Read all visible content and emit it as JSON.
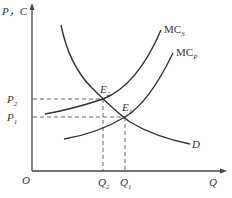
{
  "diagram": {
    "title": "",
    "axes": {
      "y_label": "P，C",
      "x_label": "Q",
      "origin_label": "O"
    },
    "curves": [
      {
        "id": "D",
        "label": "D",
        "description": "Demand curve, downward sloping"
      },
      {
        "id": "MCs",
        "label": "MC",
        "label_sub": "S",
        "description": "Social marginal cost curve"
      },
      {
        "id": "MCp",
        "label": "MC",
        "label_sub": "P",
        "description": "Private marginal cost curve"
      }
    ],
    "points": [
      {
        "id": "E2",
        "label": "E",
        "label_sub": "2",
        "description": "Intersection of D and MCs"
      },
      {
        "id": "E1",
        "label": "E",
        "label_sub": "1",
        "description": "Intersection of D and MCp"
      }
    ],
    "y_ticks": [
      {
        "label": "P",
        "sub": "2"
      },
      {
        "label": "P",
        "sub": "1"
      }
    ],
    "x_ticks": [
      {
        "label": "Q",
        "sub": "2"
      },
      {
        "label": "Q",
        "sub": "1"
      }
    ],
    "colors": {
      "line": "#333333",
      "axis": "#444444",
      "dash": "#555555",
      "background": "#ffffff"
    }
  }
}
